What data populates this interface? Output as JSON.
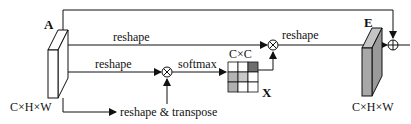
{
  "diagram": {
    "input": {
      "name": "A",
      "shape": "C×H×W",
      "fill": "#ffffff"
    },
    "output": {
      "name": "E",
      "shape": "C×H×W",
      "fill": "#a8a8a8"
    },
    "matrix": {
      "name": "X",
      "shape": "C×C",
      "cells": [
        [
          "#ffffff",
          "#ffffff",
          "#6e6e6e"
        ],
        [
          "#b4b4b4",
          "#c8c8c8",
          "#ffffff"
        ],
        [
          "#b0b0b0",
          "#ffffff",
          "#ffffff"
        ]
      ]
    },
    "labels": {
      "reshape_top": "reshape",
      "reshape_mid": "reshape",
      "reshape_transpose": "reshape & transpose",
      "softmax": "softmax",
      "reshape_out": "reshape"
    },
    "operators": {
      "matmul": "⊗",
      "add": "⊕"
    }
  }
}
